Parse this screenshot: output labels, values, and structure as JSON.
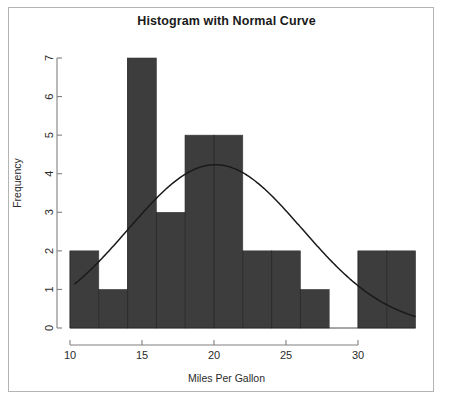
{
  "chart": {
    "title": "Histogram with Normal Curve",
    "xlabel": "Miles Per Gallon",
    "ylabel": "Frequency",
    "bar_color": "#3d3d3d",
    "curve_color": "#1a1a1a",
    "axis_color": "#808080",
    "frame_color": "#b4b4b4",
    "background": "#ffffff"
  },
  "chart_data": {
    "type": "bar",
    "title": "Histogram with Normal Curve",
    "xlabel": "Miles Per Gallon",
    "ylabel": "Frequency",
    "xlim": [
      10,
      34
    ],
    "ylim": [
      0,
      7
    ],
    "grid": false,
    "legend": null,
    "bin_width": 2,
    "bin_edges": [
      10,
      12,
      14,
      16,
      18,
      20,
      22,
      24,
      26,
      28,
      30,
      32,
      34
    ],
    "categories": [
      "10-12",
      "12-14",
      "14-16",
      "16-18",
      "18-20",
      "20-22",
      "22-24",
      "24-26",
      "26-28",
      "28-30",
      "30-32",
      "32-34"
    ],
    "values": [
      2,
      1,
      7,
      3,
      5,
      5,
      2,
      2,
      1,
      0,
      2,
      2
    ],
    "x_tick_labels": [
      "10",
      "15",
      "20",
      "25",
      "30"
    ],
    "x_tick_values": [
      10,
      15,
      20,
      25,
      30
    ],
    "y_tick_labels": [
      "0",
      "1",
      "2",
      "3",
      "4",
      "5",
      "6",
      "7"
    ],
    "y_tick_values": [
      0,
      1,
      2,
      3,
      4,
      5,
      6,
      7
    ],
    "overlay": {
      "type": "line",
      "name": "normal curve",
      "mean": 20.09,
      "sd": 6.03,
      "n": 32,
      "scale": 64,
      "peak_value": 4.24,
      "peak_x": 20.09
    }
  }
}
